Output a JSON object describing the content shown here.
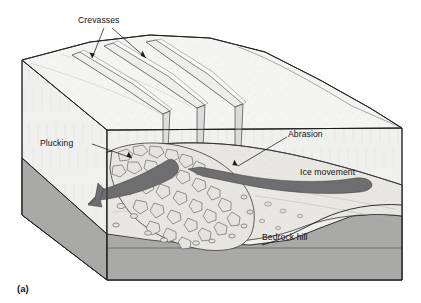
{
  "figure": {
    "caption_label": "(a)"
  },
  "labels": {
    "crevasses": "Crevasses",
    "plucking": "Plucking",
    "abrasion": "Abrasion",
    "ice_movement": "Ice movement",
    "bedrock_hill": "Bedrock hill"
  },
  "colors": {
    "ice_top": "#f4f4f2",
    "ice_front": "#ececea",
    "ice_side": "#e4e4e2",
    "bedrock_gray": "#a8a8a6",
    "bedrock_front": "#b4b4b2",
    "rubble_fill": "#e8e6e0",
    "arrow_fill": "#6e6e70",
    "outline": "#1d1d1d",
    "text": "#111111",
    "background": "#ffffff"
  },
  "elements": {
    "crevasse_count": 3,
    "arrow_count": 2,
    "arrow_direction": "left",
    "view": "3d-block-diagram"
  }
}
